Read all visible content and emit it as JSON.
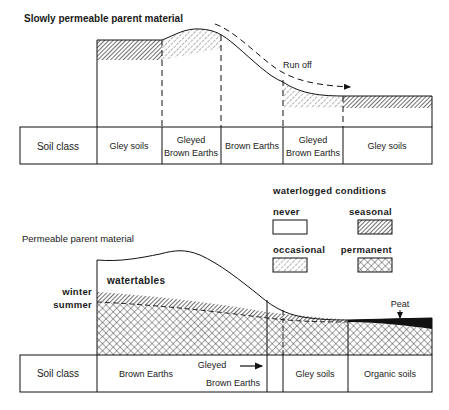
{
  "top_panel": {
    "title": "Slowly permeable parent material",
    "runoff_label": "Run off",
    "table": {
      "header": "Soil class",
      "cells": [
        {
          "line1": "Gley soils",
          "line2": ""
        },
        {
          "line1": "Gleyed",
          "line2": "Brown Earths"
        },
        {
          "line1": "Brown Earths",
          "line2": ""
        },
        {
          "line1": "Gleyed",
          "line2": "Brown Earths"
        },
        {
          "line1": "Gley soils",
          "line2": ""
        }
      ]
    }
  },
  "legend": {
    "title": "waterlogged conditions",
    "items": [
      {
        "label": "never",
        "pattern": "none"
      },
      {
        "label": "seasonal",
        "pattern": "dense-diagonal"
      },
      {
        "label": "occasional",
        "pattern": "sparse-diagonal"
      },
      {
        "label": "permanent",
        "pattern": "crosshatch"
      }
    ]
  },
  "bottom_panel": {
    "title": "Permeable parent material",
    "watertables_label": "watertables",
    "winter_label": "winter",
    "summer_label": "summer",
    "peat_label": "Peat",
    "table": {
      "header": "Soil class",
      "cells": [
        {
          "line1": "Brown Earths"
        },
        {
          "line1": "Gleyed",
          "line2": "Brown Earths"
        },
        {
          "line1": "Gley soils"
        },
        {
          "line1": "Organic soils"
        }
      ]
    }
  }
}
